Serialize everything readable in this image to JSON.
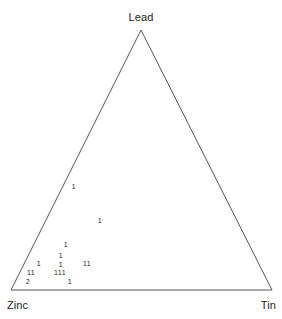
{
  "chart_data": {
    "type": "scatter",
    "title": "",
    "subtitle": "",
    "xlabel": "",
    "ylabel": "",
    "grid": false,
    "legend": null,
    "layout": "ternary",
    "axes": [
      {
        "name": "Lead",
        "position": "top"
      },
      {
        "name": "Zinc",
        "position": "bottom-left"
      },
      {
        "name": "Tin",
        "position": "bottom-right"
      }
    ],
    "marker_style": "count-label",
    "points": [
      {
        "label": "1",
        "x": 74,
        "y": 187
      },
      {
        "label": "1",
        "x": 100,
        "y": 221
      },
      {
        "label": "1",
        "x": 66,
        "y": 245
      },
      {
        "label": "1",
        "x": 61,
        "y": 256
      },
      {
        "label": "1",
        "x": 61,
        "y": 265
      },
      {
        "label": "1",
        "x": 39,
        "y": 264
      },
      {
        "label": "11",
        "x": 87,
        "y": 264
      },
      {
        "label": "11",
        "x": 31,
        "y": 273
      },
      {
        "label": "111",
        "x": 60,
        "y": 273
      },
      {
        "label": "2",
        "x": 28,
        "y": 282
      },
      {
        "label": "1",
        "x": 70,
        "y": 282
      }
    ],
    "total_observations": 15
  },
  "chart": {
    "vertices": {
      "lead": "Lead",
      "zinc": "Zinc",
      "tin": "Tin"
    },
    "geometry": {
      "apex_x": 141,
      "apex_y": 30,
      "left_x": 11,
      "left_y": 290,
      "right_x": 272,
      "right_y": 290
    },
    "colors": {
      "outline": "#555555",
      "text": "#1a1a1a",
      "point_text": "#222222",
      "background": "#ffffff"
    }
  }
}
